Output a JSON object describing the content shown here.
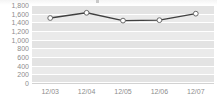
{
  "chart_data": {
    "type": "line",
    "title": "",
    "subtitle": "",
    "xlabel": "",
    "ylabel": "",
    "categories": [
      "12/03",
      "12/04",
      "12/05",
      "12/06",
      "12/07"
    ],
    "values": [
      1500,
      1620,
      1440,
      1450,
      1600
    ],
    "series": [
      {
        "name": "",
        "values": [
          1500,
          1620,
          1440,
          1450,
          1600
        ]
      }
    ],
    "ylim": [
      0,
      1800
    ],
    "ytick_values": [
      0,
      200,
      400,
      600,
      800,
      1000,
      1200,
      1400,
      1600,
      1800
    ],
    "ytick_labels": [
      "0",
      "200",
      "400",
      "600",
      "800",
      "1,000",
      "1,200",
      "1,400",
      "1,600",
      "1,800"
    ],
    "xtick_labels": [
      "12/03",
      "12/04",
      "12/05",
      "12/06",
      "12/07"
    ],
    "grid": true,
    "legend": false,
    "legend_position": "none",
    "colors": {
      "line": "#404040",
      "marker_fill": "#ffffff",
      "marker_stroke": "#6b6b6b",
      "plot_background": "#eaeaea",
      "band": "#e3e3e3",
      "gridline": "#ffffff",
      "axis_text": "#8d8d8d",
      "baseline": "#d2d2d2",
      "page_background": "#ffffff"
    }
  },
  "top_clip": {
    "ghost_text": ""
  }
}
